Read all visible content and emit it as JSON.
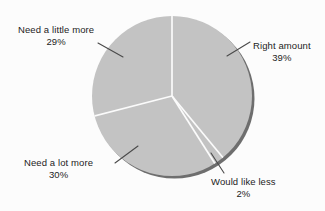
{
  "chart_data": {
    "type": "pie",
    "title": "",
    "subtitle": "",
    "xlabel": "",
    "ylabel": "",
    "legend_position": "none",
    "grid": false,
    "start_angle_deg": 0,
    "direction": "clockwise",
    "categories": [
      "Right amount",
      "Would like less",
      "Need a lot more",
      "Need a little more"
    ],
    "values": [
      39,
      2,
      30,
      29
    ],
    "value_unit": "%",
    "slices": [
      {
        "label": "Right amount",
        "value": 39,
        "percent_text": "39%",
        "color": "#c3c3c3",
        "start_deg": 0,
        "end_deg": 140.4
      },
      {
        "label": "Would like less",
        "value": 2,
        "percent_text": "2%",
        "color": "#c3c3c3",
        "start_deg": 140.4,
        "end_deg": 147.6
      },
      {
        "label": "Need a lot more",
        "value": 30,
        "percent_text": "30%",
        "color": "#c3c3c3",
        "start_deg": 147.6,
        "end_deg": 255.6
      },
      {
        "label": "Need a little more",
        "value": 29,
        "percent_text": "29%",
        "color": "#c3c3c3",
        "start_deg": 255.6,
        "end_deg": 360
      }
    ],
    "colors": {
      "slice_fill": "#c3c3c3",
      "slice_separator": "#fbfbfb",
      "shadow_rim": "#6e6e6e",
      "background": "#fcfcfc",
      "text": "#1d1d1d",
      "leader_line": "#4a4a4a"
    }
  },
  "labels": {
    "right_amount": {
      "name": "Right amount",
      "percent": "39%"
    },
    "need_little_more": {
      "name": "Need a little more",
      "percent": "29%"
    },
    "need_lot_more": {
      "name": "Need a lot more",
      "percent": "30%"
    },
    "would_like_less": {
      "name": "Would like less",
      "percent": "2%"
    }
  }
}
